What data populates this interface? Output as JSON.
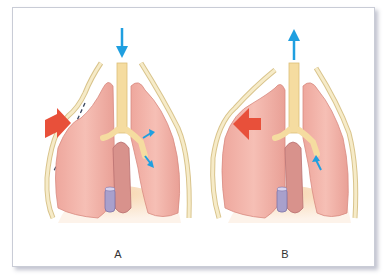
{
  "figure": {
    "panels": [
      {
        "label": "A",
        "airflow_arrow": "down",
        "chest_wall_motion": "inward (paradoxical, flail segment)",
        "small_arrows": [
          "bronchus-outward",
          "bronchus-inward"
        ]
      },
      {
        "label": "B",
        "airflow_arrow": "up",
        "chest_wall_motion": "outward",
        "small_arrows": [
          "bronchus-inward"
        ]
      }
    ],
    "colors": {
      "lung": "#f2b2a8",
      "lung_shadow": "#e59a90",
      "trachea": "#f5dca0",
      "rib": "#f2e2b8",
      "heart_vessel": "#a8a0cc",
      "airflow_arrow": "#1f9fe0",
      "chest_motion_arrow": "#e8503a",
      "border": "#c9ccd6"
    }
  }
}
